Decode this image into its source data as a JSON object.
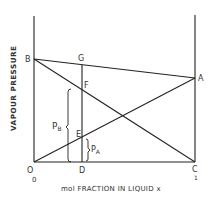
{
  "diagram": {
    "type": "vapour-pressure-composition",
    "ylabel": "VAPOUR PRESSURE",
    "xlabel": "mol FRACTION IN LIQUID x",
    "x_tick_left": "0",
    "x_tick_right": "1",
    "points": {
      "O": "O",
      "B": "B",
      "G": "G",
      "F": "F",
      "E": "E",
      "D": "D",
      "A": "A",
      "C": "C"
    },
    "annotations": {
      "pb": "P",
      "pb_sub": "B",
      "pa": "P",
      "pa_sub": "A"
    },
    "line_color": "#222222"
  }
}
